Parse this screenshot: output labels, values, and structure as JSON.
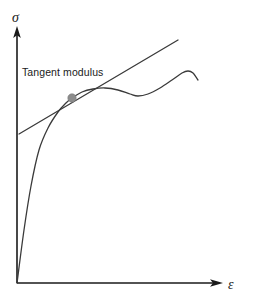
{
  "figure": {
    "title": "",
    "background_color": "#ffffff",
    "width": 258,
    "height": 299
  },
  "axes": {
    "y_axis_label": "σ",
    "x_axis_label": "ε",
    "y_axis_label_name": "stress",
    "x_axis_label_name": "strain",
    "axis_color": "#1a1a1a",
    "origin": [
      17,
      283
    ],
    "y_axis_top": [
      17,
      28
    ],
    "x_axis_right": [
      222,
      283
    ],
    "ticks": [],
    "gridlines": false
  },
  "annotations": [
    {
      "id": "tangent-modulus",
      "text": "Tangent modulus",
      "x": 22,
      "y": 76
    }
  ],
  "marker": {
    "name": "tangent-point-marker",
    "x": 72,
    "y": 98,
    "radius": 4.2,
    "color": "#8c8c8c"
  },
  "chart_data": {
    "type": "line",
    "title": "",
    "subtitle": "",
    "xlabel": "ε",
    "ylabel": "σ",
    "xlim": [
      0,
      1
    ],
    "ylim": [
      0,
      1
    ],
    "grid": false,
    "legend": null,
    "legend_position": "none",
    "annotations": [
      "Tangent modulus"
    ],
    "series": [
      {
        "name": "stress-strain-curve",
        "type": "curve",
        "color": "#3a3a3a",
        "comment": "Stress-strain response: steep elastic rise from origin, knee, plateau, slight drop, then rise to a local peak and final fall.",
        "points_px": [
          [
            17,
            283
          ],
          [
            24,
            230
          ],
          [
            31,
            186
          ],
          [
            39,
            150
          ],
          [
            48,
            128
          ],
          [
            58,
            112
          ],
          [
            66,
            103
          ],
          [
            72,
            98
          ],
          [
            82,
            92
          ],
          [
            93,
            89
          ],
          [
            105,
            88
          ],
          [
            118,
            90
          ],
          [
            130,
            94
          ],
          [
            138,
            96
          ],
          [
            148,
            94
          ],
          [
            160,
            88
          ],
          [
            172,
            80
          ],
          [
            182,
            73
          ],
          [
            188,
            71
          ],
          [
            193,
            73
          ],
          [
            198,
            80
          ]
        ],
        "x_norm": [
          0.0,
          0.034,
          0.068,
          0.107,
          0.151,
          0.2,
          0.239,
          0.268,
          0.317,
          0.371,
          0.429,
          0.493,
          0.551,
          0.59,
          0.639,
          0.698,
          0.756,
          0.805,
          0.834,
          0.859,
          0.883
        ],
        "y_norm": [
          0.0,
          0.208,
          0.38,
          0.521,
          0.607,
          0.67,
          0.705,
          0.725,
          0.749,
          0.761,
          0.765,
          0.757,
          0.741,
          0.733,
          0.741,
          0.765,
          0.796,
          0.823,
          0.831,
          0.823,
          0.796
        ]
      },
      {
        "name": "tangent-line",
        "type": "line",
        "color": "#3a3a3a",
        "comment": "Straight tangent line touching the curve at the tangent point; its slope is the tangent modulus.",
        "points_px": [
          [
            19,
            134
          ],
          [
            178,
            40
          ]
        ],
        "touch_point_px": [
          72,
          98
        ],
        "slope_px": -0.591
      }
    ]
  }
}
